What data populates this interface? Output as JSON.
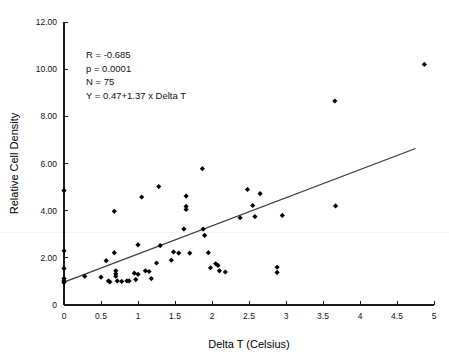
{
  "chart_data": {
    "type": "scatter",
    "title": "",
    "xlabel": "Delta T (Celsius)",
    "ylabel": "Relative Cell Density",
    "xlim": [
      0,
      5
    ],
    "ylim": [
      0,
      12
    ],
    "xticks": [
      0,
      0.5,
      1,
      1.5,
      2,
      2.5,
      3,
      3.5,
      4,
      4.5,
      5
    ],
    "xtick_labels": [
      "0",
      "0.5",
      "1",
      "1.5",
      "2",
      "2.5",
      "3",
      "3.5",
      "4",
      "4.5",
      "5"
    ],
    "yticks": [
      0,
      2,
      4,
      6,
      8,
      10,
      12
    ],
    "ytick_labels": [
      "0",
      "2.00",
      "4.00",
      "6.00",
      "8.00",
      "10.00",
      "12.00"
    ],
    "grid": false,
    "legend": "none",
    "marker": "filled-diamond",
    "marker_color": "#000000",
    "fit_line": {
      "label": "Y = 0.47+1.37 x Delta T",
      "intercept": 0.47,
      "slope": 1.37,
      "color": "#3a3a3a",
      "x_start": 0.0,
      "x_end": 4.75,
      "y_start": 0.97,
      "y_end": 6.64
    },
    "annotations": [
      "R = -0.685",
      "p = 0.0001",
      "N = 75",
      "Y = 0.47+1.37 x Delta T"
    ],
    "stats": {
      "R": "-0.685",
      "p": "0.0001",
      "N": "75",
      "equation": "Y = 0.47+1.37 x Delta T"
    },
    "points": [
      [
        0.0,
        4.85
      ],
      [
        0.0,
        2.3
      ],
      [
        0.0,
        1.55
      ],
      [
        0.0,
        1.12
      ],
      [
        0.0,
        1.02
      ],
      [
        0.0,
        0.95
      ],
      [
        0.28,
        1.22
      ],
      [
        0.5,
        1.18
      ],
      [
        0.57,
        1.88
      ],
      [
        0.6,
        1.02
      ],
      [
        0.62,
        0.98
      ],
      [
        0.68,
        3.97
      ],
      [
        0.68,
        2.22
      ],
      [
        0.7,
        1.45
      ],
      [
        0.7,
        1.32
      ],
      [
        0.7,
        1.22
      ],
      [
        0.72,
        1.02
      ],
      [
        0.78,
        1.0
      ],
      [
        0.85,
        1.02
      ],
      [
        0.88,
        1.02
      ],
      [
        0.95,
        1.35
      ],
      [
        0.97,
        1.08
      ],
      [
        1.0,
        2.55
      ],
      [
        1.0,
        1.3
      ],
      [
        1.05,
        4.58
      ],
      [
        1.1,
        1.45
      ],
      [
        1.15,
        1.42
      ],
      [
        1.18,
        1.12
      ],
      [
        1.25,
        1.78
      ],
      [
        1.28,
        5.02
      ],
      [
        1.3,
        2.52
      ],
      [
        1.45,
        1.9
      ],
      [
        1.48,
        2.25
      ],
      [
        1.55,
        2.2
      ],
      [
        1.62,
        3.22
      ],
      [
        1.65,
        4.62
      ],
      [
        1.65,
        4.18
      ],
      [
        1.65,
        4.05
      ],
      [
        1.7,
        2.2
      ],
      [
        1.87,
        5.78
      ],
      [
        1.88,
        3.22
      ],
      [
        1.9,
        2.95
      ],
      [
        1.95,
        2.22
      ],
      [
        1.98,
        1.58
      ],
      [
        2.05,
        1.75
      ],
      [
        2.08,
        1.68
      ],
      [
        2.1,
        1.45
      ],
      [
        2.18,
        1.4
      ],
      [
        2.38,
        3.7
      ],
      [
        2.48,
        4.9
      ],
      [
        2.55,
        4.22
      ],
      [
        2.58,
        3.75
      ],
      [
        2.65,
        4.72
      ],
      [
        2.88,
        1.6
      ],
      [
        2.88,
        1.38
      ],
      [
        2.95,
        3.8
      ],
      [
        3.66,
        8.65
      ],
      [
        3.67,
        4.2
      ],
      [
        4.87,
        10.2
      ]
    ]
  },
  "axes": {
    "x_axis_label": "Delta T (Celsius)",
    "y_axis_label": "Relative Cell Density"
  }
}
